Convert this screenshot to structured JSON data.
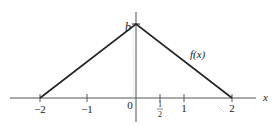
{
  "diagram": {
    "x_axis_label": "x",
    "y_peak_label": "b",
    "curve_label": "f(x)",
    "ticks": [
      {
        "value": -2,
        "label": "−2"
      },
      {
        "value": -1,
        "label": "−1"
      },
      {
        "value": 0,
        "label": "0"
      },
      {
        "value": 0.5,
        "label_num": "1",
        "label_den": "2"
      },
      {
        "value": 1,
        "label": "1"
      },
      {
        "value": 2,
        "label": "2"
      }
    ],
    "points": [
      [
        -2,
        0
      ],
      [
        0,
        "b"
      ],
      [
        2,
        0
      ]
    ]
  }
}
